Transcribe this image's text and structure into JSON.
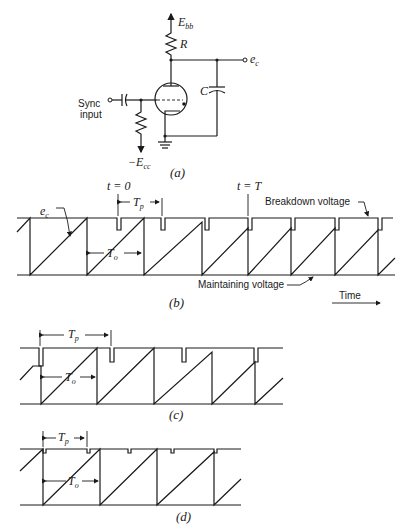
{
  "circuit": {
    "supply_label": "E",
    "supply_sub": "bb",
    "resistor_label": "R",
    "capacitor_label": "C",
    "output_label": "e",
    "output_sub": "c",
    "input_label_line1": "Sync",
    "input_label_line2": "input",
    "bias_label": "−E",
    "bias_sub": "cc",
    "caption": "(a)"
  },
  "panel_b": {
    "t0_label": "t = 0",
    "tT_label": "t = T",
    "Tp_label": "T",
    "Tp_sub": "p",
    "To_label": "T",
    "To_sub": "o",
    "ec_label": "e",
    "ec_sub": "c",
    "breakdown_label": "Breakdown voltage",
    "maintaining_label": "Maintaining voltage",
    "time_label": "Time",
    "caption": "(b)"
  },
  "panel_c": {
    "Tp_label": "T",
    "Tp_sub": "p",
    "To_label": "T",
    "To_sub": "o",
    "caption": "(c)"
  },
  "panel_d": {
    "Tp_label": "T",
    "Tp_sub": "p",
    "To_label": "T",
    "To_sub": "o",
    "caption": "(d)"
  }
}
